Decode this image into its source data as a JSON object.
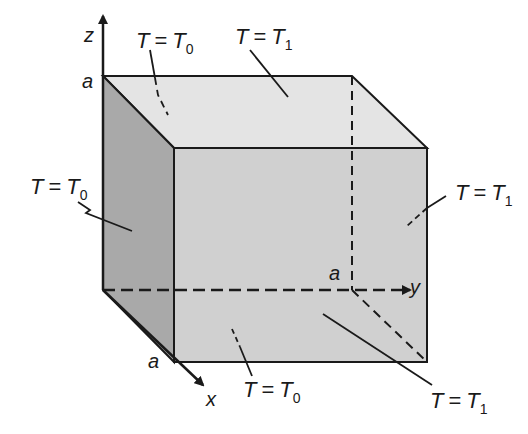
{
  "diagram": {
    "axes": {
      "z": {
        "label": "z",
        "tick": "a"
      },
      "y": {
        "label": "y",
        "tick": "a"
      },
      "x": {
        "label": "x",
        "tick": "a"
      }
    },
    "faces": {
      "top": {
        "T": "T",
        "eq": "=",
        "sym": "T",
        "sub": "1"
      },
      "back_z": {
        "T": "T",
        "eq": "=",
        "sym": "T",
        "sub": "0"
      },
      "left": {
        "T": "T",
        "eq": "=",
        "sym": "T",
        "sub": "0"
      },
      "right": {
        "T": "T",
        "eq": "=",
        "sym": "T",
        "sub": "1"
      },
      "bottom": {
        "T": "T",
        "eq": "=",
        "sym": "T",
        "sub": "0"
      },
      "front_lower": {
        "T": "T",
        "eq": "=",
        "sym": "T",
        "sub": "1"
      }
    },
    "colors": {
      "top_face": "#e4e4e4",
      "front_face": "#d0d0d0",
      "left_face": "#a9a9a9",
      "edge": "#1a1a1a"
    }
  }
}
